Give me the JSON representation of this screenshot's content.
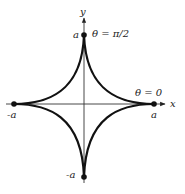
{
  "diagram": {
    "type": "astroid",
    "axes": {
      "x_label": "x",
      "y_label": "y"
    },
    "cusp_labels": {
      "top": "a",
      "bottom": "-a",
      "left": "-a",
      "right": "a"
    },
    "annotations": {
      "top": "θ = π/2",
      "right": "θ = 0"
    },
    "colors": {
      "curve": "#111111",
      "axis": "#333333",
      "background": "#ffffff"
    }
  }
}
